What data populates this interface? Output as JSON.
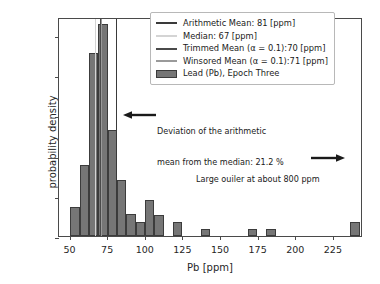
{
  "chart_data": {
    "type": "bar",
    "title": "",
    "xlabel": "Pb [ppm]",
    "ylabel": "probability density",
    "xlim": [
      43,
      245
    ],
    "ylim": [
      0,
      0.0545
    ],
    "xticks": [
      50,
      75,
      100,
      125,
      150,
      175,
      200,
      225
    ],
    "yticks": [
      "0.00",
      "0.01",
      "0.02",
      "0.03",
      "0.04",
      "0.05"
    ],
    "ytick_values": [
      0.0,
      0.01,
      0.02,
      0.03,
      0.04,
      0.05
    ],
    "grid": false,
    "legend_position": "upper right",
    "bin_width": 6.2,
    "bars": [
      {
        "x": 50.5,
        "value": 0.0071
      },
      {
        "x": 56.7,
        "value": 0.0177
      },
      {
        "x": 62.9,
        "value": 0.0456
      },
      {
        "x": 69.1,
        "value": 0.0527
      },
      {
        "x": 75.3,
        "value": 0.0263
      },
      {
        "x": 81.5,
        "value": 0.014
      },
      {
        "x": 87.7,
        "value": 0.0054
      },
      {
        "x": 93.9,
        "value": 0.0036
      },
      {
        "x": 100.1,
        "value": 0.0089
      },
      {
        "x": 106.3,
        "value": 0.0053
      },
      {
        "x": 118.7,
        "value": 0.0036
      },
      {
        "x": 137.3,
        "value": 0.0018
      },
      {
        "x": 168.3,
        "value": 0.0018
      },
      {
        "x": 180.7,
        "value": 0.0018
      },
      {
        "x": 236.5,
        "value": 0.0035
      }
    ],
    "vlines": [
      {
        "name": "arithmetic-mean",
        "x": 81,
        "color": "#3a3a3a"
      },
      {
        "name": "median",
        "x": 67,
        "color": "#d4d4d4"
      },
      {
        "name": "trimmed-mean",
        "x": 70,
        "color": "#4a4a4a"
      },
      {
        "name": "winsored-mean",
        "x": 71,
        "color": "#9a9a9a"
      }
    ],
    "series_label": "Lead (Pb), Epoch Three",
    "bar_color": "#767676",
    "bar_edge_color": "#3c3c3c"
  },
  "legend": {
    "items": [
      {
        "label": "Arithmetic Mean: 81 [ppm]",
        "marker": "line",
        "color": "#3a3a3a",
        "name": "arithmetic-mean"
      },
      {
        "label": "Median: 67 [ppm]",
        "marker": "line",
        "color": "#d4d4d4",
        "name": "median"
      },
      {
        "label": "Trimmed Mean (α = 0.1):70 [ppm]",
        "marker": "line",
        "color": "#4a4a4a",
        "name": "trimmed-mean"
      },
      {
        "label": "Winsored Mean (α = 0.1):71 [ppm]",
        "marker": "line",
        "color": "#9a9a9a",
        "name": "winsored-mean"
      },
      {
        "label": "Lead (Pb), Epoch Three",
        "marker": "patch",
        "color": "#767676",
        "name": "histogram-series"
      }
    ]
  },
  "annotations": [
    {
      "name": "deviation-annotation",
      "line1": "Deviation of the arithmetic",
      "line2": "mean from the median: 21.2 %",
      "arrow": "left"
    },
    {
      "name": "outlier-annotation",
      "line1": "Large ouiler at about 800 ppm",
      "arrow": "right"
    }
  ]
}
